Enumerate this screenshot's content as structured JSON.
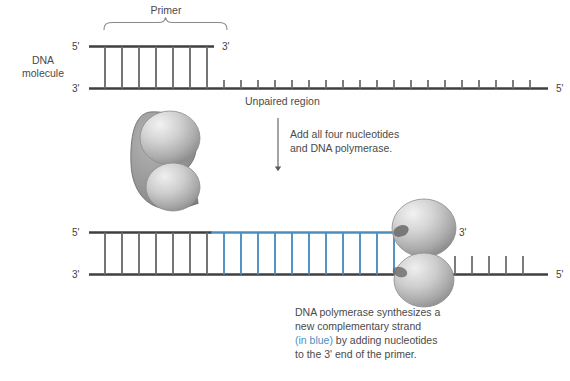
{
  "figure": {
    "background": "#ffffff"
  },
  "colors": {
    "strand_gray": "#3f3f3f",
    "rung_gray": "#6e6e6e",
    "new_strand_blue": "#4a8fc4",
    "text_gray": "#4a4a4a",
    "enzyme_light": "#e2e2e2",
    "enzyme_mid": "#a8a8a8",
    "enzyme_dark": "#808080"
  },
  "top_panel": {
    "primer_bracket_label": "Primer",
    "dna_molecule_label_line1": "DNA",
    "dna_molecule_label_line2": "molecule",
    "top_strand_left_prime": "5'",
    "top_strand_right_prime": "3'",
    "bottom_strand_left_prime": "3'",
    "bottom_strand_right_prime": "5'",
    "unpaired_region_label": "Unpaired region",
    "primer_rung_count": 7,
    "unpaired_tick_count": 21
  },
  "arrow_step": {
    "line1": "Add all four nucleotides",
    "line2": "and DNA polymerase."
  },
  "bottom_panel": {
    "top_strand_left_prime": "5'",
    "top_strand_right_prime": "3'",
    "bottom_strand_left_prime": "3'",
    "bottom_strand_right_prime": "5'",
    "primer_rung_count": 7,
    "new_strand_rung_count": 11,
    "remaining_tick_count": 5
  },
  "caption": {
    "line1": "DNA polymerase synthesizes a",
    "line2": "new complementary strand",
    "line3_blue": "(in blue)",
    "line3_rest": " by adding nucleotides",
    "line4": "to the 3' end of the primer."
  }
}
